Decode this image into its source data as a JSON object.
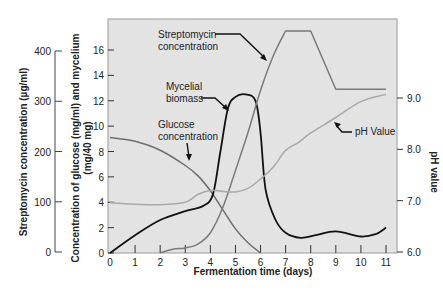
{
  "chart_data": {
    "type": "line",
    "title": "",
    "xlabel": "Fermentation time (days)",
    "ylabel": "Concentration of glucose (mg/ml) and mycelium (mg/40 mg)",
    "ylabel_line1": "Concentration of glucose (mg/ml) and mycelium",
    "ylabel_line2": "(mg/40 mg)",
    "y2label": "pH value",
    "y3label": "Streptomycin concentration (µg/ml)",
    "xlim": [
      0,
      11
    ],
    "ylim": [
      0,
      17.5
    ],
    "y2lim": [
      6.0,
      9.0
    ],
    "y3lim": [
      0,
      400
    ],
    "x_ticks": [
      "0",
      "1",
      "2",
      "3",
      "4",
      "5",
      "6",
      "7",
      "8",
      "9",
      "10",
      "11"
    ],
    "y_ticks": [
      "0",
      "2",
      "4",
      "6",
      "8",
      "10",
      "12",
      "14",
      "16"
    ],
    "y2_ticks": [
      "6.0",
      "7.0",
      "8.0",
      "9.0"
    ],
    "y3_ticks": [
      "0",
      "100",
      "200",
      "300",
      "400"
    ],
    "grid": false,
    "series": [
      {
        "name": "Glucose concentration",
        "axis": "left",
        "color": "#6e6e6e",
        "x": [
          0,
          1,
          2,
          3,
          3.5,
          4,
          4.5,
          5,
          5.5,
          6
        ],
        "values": [
          9.1,
          8.8,
          8.1,
          6.9,
          6.1,
          4.9,
          3.4,
          1.9,
          0.8,
          0
        ]
      },
      {
        "name": "Mycelial biomass",
        "axis": "left",
        "color": "#111111",
        "x": [
          0,
          1,
          2,
          3,
          3.7,
          4.1,
          4.4,
          4.7,
          5.0,
          5.4,
          5.8,
          6.0,
          6.2,
          6.6,
          7.0,
          7.6,
          8.2,
          9.0,
          10.0,
          10.6,
          11.0
        ],
        "values": [
          0,
          1.4,
          2.6,
          3.3,
          3.7,
          4.6,
          8.0,
          11.4,
          12.3,
          12.5,
          12.0,
          9.5,
          5.0,
          2.6,
          1.6,
          1.2,
          1.4,
          1.7,
          1.3,
          1.5,
          2.0
        ]
      },
      {
        "name": "Streptomycin concentration",
        "axis": "left",
        "units_note": "left-axis units; multiply by 25 for µg/ml",
        "color": "#7a7a7a",
        "x": [
          2.0,
          2.5,
          3.0,
          3.5,
          4.0,
          4.5,
          5.0,
          5.5,
          6.0,
          6.5,
          7.0,
          8.0,
          9.0,
          11.0
        ],
        "values": [
          0,
          0.3,
          0.4,
          0.7,
          1.6,
          3.6,
          6.5,
          9.5,
          12.8,
          15.5,
          17.5,
          17.5,
          12.9,
          12.9
        ]
      },
      {
        "name": "pH Value",
        "axis": "right",
        "color": "#a9a9a9",
        "x": [
          0,
          1,
          2,
          3,
          3.5,
          4,
          4.5,
          5,
          5.5,
          6,
          6.5,
          7,
          7.5,
          8,
          9,
          10,
          11
        ],
        "values": [
          6.96,
          6.93,
          6.92,
          6.97,
          7.12,
          7.2,
          7.18,
          7.17,
          7.24,
          7.42,
          7.65,
          7.98,
          8.13,
          8.32,
          8.62,
          8.93,
          9.07
        ]
      }
    ],
    "annotations": [
      {
        "lines": [
          "Streptomycin",
          "concentration"
        ],
        "target_series": "Streptomycin concentration"
      },
      {
        "lines": [
          "Mycelial",
          "biomass"
        ],
        "target_series": "Mycelial biomass"
      },
      {
        "lines": [
          "Glucose",
          "concentration"
        ],
        "target_series": "Glucose concentration"
      },
      {
        "lines": [
          "pH Value"
        ],
        "target_series": "pH Value"
      }
    ],
    "background": "#e3e3e3"
  }
}
